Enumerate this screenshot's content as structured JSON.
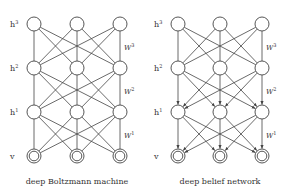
{
  "diagrams": [
    {
      "id": "dbm",
      "caption": "deep Boltzmann machine",
      "directed": false,
      "columns_x": [
        34,
        77,
        120
      ],
      "weight_label_x": 124,
      "label_x": 10,
      "layers": [
        {
          "name": "h3",
          "label": "h",
          "sup": "3",
          "y": 24,
          "visible": false
        },
        {
          "name": "h2",
          "label": "h",
          "sup": "2",
          "y": 68,
          "visible": false
        },
        {
          "name": "h1",
          "label": "h",
          "sup": "1",
          "y": 112,
          "visible": false
        },
        {
          "name": "v",
          "label": "v",
          "sup": "",
          "y": 156,
          "visible": true
        }
      ],
      "weights": [
        {
          "label": "W",
          "sup": "3",
          "y": 50
        },
        {
          "label": "W",
          "sup": "2",
          "y": 94
        },
        {
          "label": "W",
          "sup": "1",
          "y": 138
        }
      ]
    },
    {
      "id": "dbn",
      "caption": "deep belief network",
      "directed_below_top": true,
      "columns_x": [
        178,
        220,
        262
      ],
      "weight_label_x": 266,
      "label_x": 154,
      "layers": [
        {
          "name": "h3",
          "label": "h",
          "sup": "3",
          "y": 24,
          "visible": false
        },
        {
          "name": "h2",
          "label": "h",
          "sup": "2",
          "y": 68,
          "visible": false
        },
        {
          "name": "h1",
          "label": "h",
          "sup": "1",
          "y": 112,
          "visible": false
        },
        {
          "name": "v",
          "label": "v",
          "sup": "",
          "y": 156,
          "visible": true
        }
      ],
      "weights": [
        {
          "label": "W",
          "sup": "3",
          "y": 50
        },
        {
          "label": "W",
          "sup": "2",
          "y": 94
        },
        {
          "label": "W",
          "sup": "1",
          "y": 138
        }
      ]
    }
  ],
  "captions": {
    "left": "deep Boltzmann machine",
    "right": "deep belief network"
  },
  "node_radius": 7,
  "colors": {
    "stroke": "#444444",
    "text": "#333333",
    "background": "#ffffff"
  }
}
